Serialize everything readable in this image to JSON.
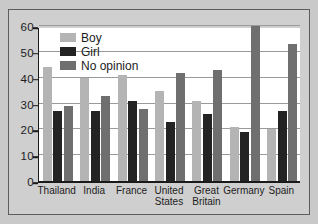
{
  "chart_data": {
    "type": "bar",
    "title": "",
    "subtitle": "",
    "xlabel": "",
    "ylabel": "",
    "ylim": [
      0,
      60
    ],
    "ytick_step": 10,
    "yticks": [
      "0",
      "10",
      "20",
      "30",
      "40",
      "50",
      "60"
    ],
    "grid": true,
    "grid_axis": "y",
    "legend_position": "top-left-inside",
    "categories": [
      "Thailand",
      "India",
      "France",
      "United States",
      "Great Britain",
      "Germany",
      "Spain"
    ],
    "series": [
      {
        "name": "Boy",
        "color": "#b4b4b4",
        "values": [
          44,
          40,
          41,
          35,
          31,
          21,
          20
        ]
      },
      {
        "name": "Girl",
        "color": "#232323",
        "values": [
          27,
          27,
          31,
          23,
          26,
          19,
          27
        ]
      },
      {
        "name": "No opinion",
        "color": "#6f6f6f",
        "values": [
          29,
          33,
          28,
          42,
          43,
          60,
          53
        ]
      }
    ]
  },
  "figure": {
    "background_color": "#c9c9c9",
    "plot_background_color": "#ffffff",
    "border_color": "#5d5d5d",
    "axis_color": "#1a1a1a",
    "gridline_color": "#9a9a9a"
  }
}
